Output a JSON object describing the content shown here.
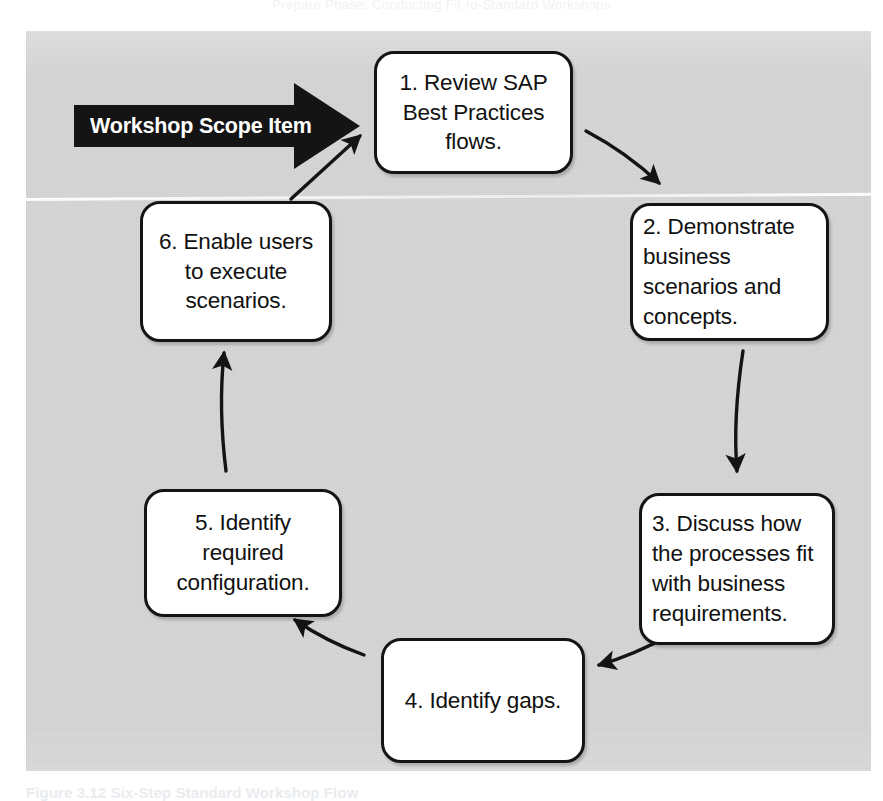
{
  "page": {
    "running_head": "Prepare Phase: Conducting Fit-to-Standard Workshops",
    "background_color": "#d6d6d6",
    "page_background_color": "#ffffff"
  },
  "figure": {
    "caption_label": "Figure 3.12",
    "caption_text": "Six-Step Standard Workshop Flow",
    "caption_full": "Figure 3.12  Six-Step Standard Workshop Flow"
  },
  "scope_arrow": {
    "label": "Workshop Scope Item",
    "fill_color": "#141414",
    "text_color": "#ffffff"
  },
  "diagram": {
    "type": "cycle",
    "node_count": 6,
    "border_color": "#141414",
    "fill_color": "#ffffff",
    "text_color": "#111111",
    "nodes": [
      {
        "id": "step-1",
        "number": "1.",
        "label": "1. Review SAP Best Practices flows.",
        "align": "center"
      },
      {
        "id": "step-2",
        "number": "2.",
        "label": "2. Demonstrate business scenarios and concepts.",
        "align": "left"
      },
      {
        "id": "step-3",
        "number": "3.",
        "label": "3. Discuss how the processes fit with business requirements.",
        "align": "left"
      },
      {
        "id": "step-4",
        "number": "4.",
        "label": "4. Identify gaps.",
        "align": "center"
      },
      {
        "id": "step-5",
        "number": "5.",
        "label": "5. Identify required configuration.",
        "align": "center"
      },
      {
        "id": "step-6",
        "number": "6.",
        "label": "6. Enable users to execute scenarios.",
        "align": "center"
      }
    ],
    "connections": [
      {
        "id": "conn-entry",
        "from": "workshop-scope-item",
        "to": "step-1",
        "style": "block-arrow"
      },
      {
        "id": "conn-1-2",
        "from": "step-1",
        "to": "step-2",
        "style": "curved-arrow"
      },
      {
        "id": "conn-2-3",
        "from": "step-2",
        "to": "step-3",
        "style": "curved-arrow"
      },
      {
        "id": "conn-3-4",
        "from": "step-3",
        "to": "step-4",
        "style": "curved-arrow"
      },
      {
        "id": "conn-4-5",
        "from": "step-4",
        "to": "step-5",
        "style": "curved-arrow"
      },
      {
        "id": "conn-5-6",
        "from": "step-5",
        "to": "step-6",
        "style": "curved-arrow"
      },
      {
        "id": "conn-6-1",
        "from": "step-6",
        "to": "step-1",
        "style": "straight-arrow"
      }
    ]
  }
}
